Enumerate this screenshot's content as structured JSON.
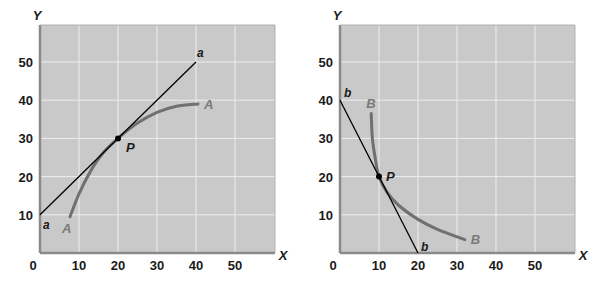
{
  "chart_data": [
    {
      "type": "line",
      "title": "",
      "xlabel": "X",
      "ylabel": "Y",
      "xlim": [
        0,
        60
      ],
      "ylim": [
        0,
        60
      ],
      "xticks": [
        0,
        10,
        20,
        30,
        40,
        50
      ],
      "yticks": [
        10,
        20,
        30,
        40,
        50
      ],
      "grid": true,
      "series": [
        {
          "name": "A",
          "kind": "curve",
          "points": [
            [
              7.7,
              9.5
            ],
            [
              10,
              15.5
            ],
            [
              13,
              21.5
            ],
            [
              16,
              26
            ],
            [
              20,
              30
            ],
            [
              25,
              34
            ],
            [
              30,
              36.8
            ],
            [
              35,
              38.4
            ],
            [
              40.5,
              39
            ]
          ]
        },
        {
          "name": "a",
          "kind": "tangent-line",
          "points": [
            [
              0,
              10
            ],
            [
              40,
              50
            ]
          ]
        }
      ],
      "annotations": [
        {
          "label": "P",
          "x": 20,
          "y": 30,
          "type": "point"
        },
        {
          "label": "a",
          "at": "line-start"
        },
        {
          "label": "a",
          "at": "line-end"
        },
        {
          "label": "A",
          "at": "curve-start"
        },
        {
          "label": "A",
          "at": "curve-end"
        }
      ]
    },
    {
      "type": "line",
      "title": "",
      "xlabel": "X",
      "ylabel": "Y",
      "xlim": [
        0,
        60
      ],
      "ylim": [
        0,
        60
      ],
      "xticks": [
        0,
        10,
        20,
        30,
        40,
        50
      ],
      "yticks": [
        10,
        20,
        30,
        40,
        50
      ],
      "grid": true,
      "series": [
        {
          "name": "B",
          "kind": "curve",
          "points": [
            [
              8,
              36.5
            ],
            [
              8.3,
              30
            ],
            [
              9,
              25
            ],
            [
              10,
              20
            ],
            [
              12,
              16
            ],
            [
              15,
              12.5
            ],
            [
              20,
              8.8
            ],
            [
              25,
              6.2
            ],
            [
              32,
              3.5
            ]
          ]
        },
        {
          "name": "b",
          "kind": "tangent-line",
          "points": [
            [
              0,
              40
            ],
            [
              20,
              0
            ]
          ]
        }
      ],
      "annotations": [
        {
          "label": "P",
          "x": 10,
          "y": 20,
          "type": "point"
        },
        {
          "label": "b",
          "at": "line-start"
        },
        {
          "label": "b",
          "at": "line-end"
        },
        {
          "label": "B",
          "at": "curve-start"
        },
        {
          "label": "B",
          "at": "curve-end"
        }
      ]
    }
  ],
  "style": {
    "plot_bg": "#c9c9c9",
    "grid_color": "#eeeeee",
    "frame_color": "#8a8a8a",
    "curve_color": "#707070",
    "line_color": "#000000"
  }
}
